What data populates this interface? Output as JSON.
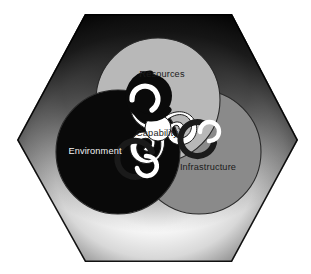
{
  "diagram": {
    "shape": "hexagon",
    "circles": [
      {
        "id": "resources",
        "label": "Resources",
        "position": "top",
        "fill": "#b8b8b8",
        "stroke": "#2a2a2a",
        "label_color": "#1b1b1b",
        "label_x": 162,
        "label_y": 77,
        "cx": 158,
        "cy": 100,
        "r": 62
      },
      {
        "id": "environment",
        "label": "Environment",
        "position": "lower-left",
        "fill": "#090909",
        "stroke": "#2a2a2a",
        "label_color": "#f2f2f2",
        "label_x": 95,
        "label_y": 154,
        "cx": 118,
        "cy": 152,
        "r": 62
      },
      {
        "id": "infrastructure",
        "label": "Infrastructure",
        "position": "lower-right",
        "fill": "#8a8a8a",
        "stroke": "#2a2a2a",
        "label_color": "#1b1b1b",
        "label_x": 208,
        "label_y": 170,
        "cx": 199,
        "cy": 152,
        "r": 62
      }
    ],
    "center": {
      "id": "capability",
      "label": "Capability",
      "fill": "#ffffff",
      "label_color": "#1b1b1b",
      "label_x": 157,
      "label_y": 136,
      "motif": "triskelion-triple-spiral"
    },
    "background": {
      "outside_color": "#ffffff",
      "hexagon_edge_color": "#000000",
      "glow_color": "#f7f7f7"
    }
  }
}
